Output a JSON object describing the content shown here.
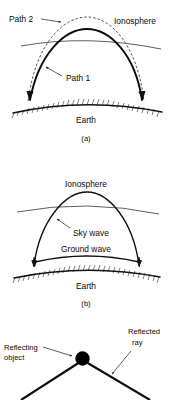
{
  "figure": {
    "background_color": "#ffffff",
    "ink_color": "#000000"
  },
  "panel_a": {
    "caption": "(a)",
    "labels": {
      "path2": "Path 2",
      "ionosphere": "Ionosphere",
      "path1": "Path 1",
      "earth": "Earth"
    }
  },
  "panel_b": {
    "caption": "(b)",
    "labels": {
      "ionosphere": "Ionosphere",
      "sky_wave": "Sky wave",
      "ground_wave": "Ground wave",
      "earth": "Earth"
    }
  },
  "panel_c": {
    "labels": {
      "reflecting_object_line1": "Reflecting",
      "reflecting_object_line2": "object",
      "reflected_ray_line1": "Reflected",
      "reflected_ray_line2": "ray"
    }
  }
}
